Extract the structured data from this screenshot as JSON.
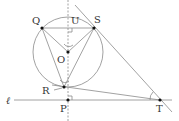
{
  "diagram": {
    "labels": {
      "Q": "Q",
      "U": "U",
      "S": "S",
      "O": "O",
      "R": "R",
      "P": "P",
      "T": "T",
      "line": "ℓ"
    },
    "points": {
      "Q": [
        42,
        28
      ],
      "S": [
        94,
        28
      ],
      "U": [
        68,
        28
      ],
      "O": [
        68,
        52
      ],
      "R": [
        64,
        87
      ],
      "P": [
        68,
        100
      ],
      "T": [
        160,
        100
      ]
    },
    "circle": {
      "center": "O",
      "radius": 35
    },
    "colors": {
      "line": "#8a8a8a",
      "point": "#111111"
    }
  }
}
